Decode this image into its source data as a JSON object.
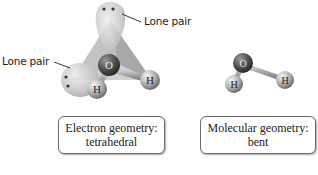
{
  "diagram": {
    "left_model": {
      "name": "tetrahedral-model",
      "central_atom": "O",
      "bonded_atoms": [
        "H",
        "H"
      ],
      "lone_pair_labels": [
        "Lone pair",
        "Lone pair"
      ]
    },
    "right_model": {
      "name": "bent-model",
      "central_atom": "O",
      "bonded_atoms": [
        "H",
        "H"
      ]
    },
    "captions": [
      {
        "line1": "Electron geometry:",
        "line2": "tetrahedral"
      },
      {
        "line1": "Molecular geometry:",
        "line2": "bent"
      }
    ],
    "colors": {
      "oxygen": "#5a5a5a",
      "hydrogen": "#b5b5b5",
      "lone_pair_lobe": "#c8c8c8",
      "tetrahedron_face": "#9a9a9a",
      "box_border": "#6b6b6b"
    }
  }
}
